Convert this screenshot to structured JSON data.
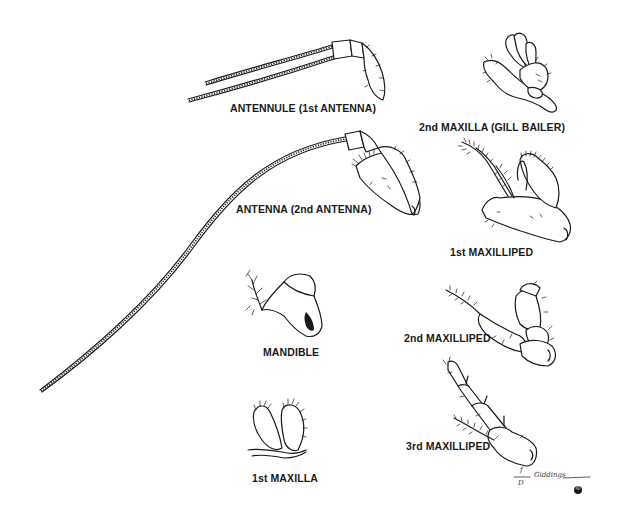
{
  "diagram": {
    "colors": {
      "background": "#ffffff",
      "ink": "#1a1a1a"
    },
    "parts": [
      {
        "id": "antennule",
        "label": "ANTENNULE (1st ANTENNA)"
      },
      {
        "id": "second-maxilla",
        "label": "2nd MAXILLA (GILL BAILER)"
      },
      {
        "id": "antenna",
        "label": "ANTENNA (2nd ANTENNA)"
      },
      {
        "id": "first-maxilliped",
        "label": "1st MAXILLIPED"
      },
      {
        "id": "mandible",
        "label": "MANDIBLE"
      },
      {
        "id": "second-maxilliped",
        "label": "2nd MAXILLIPED"
      },
      {
        "id": "third-maxilliped",
        "label": "3rd MAXILLIPED"
      },
      {
        "id": "first-maxilla",
        "label": "1st MAXILLA"
      }
    ],
    "signature": {
      "initials_top": "f",
      "initials_bottom": "D",
      "name": "Giddings",
      "copyright": "©"
    }
  }
}
